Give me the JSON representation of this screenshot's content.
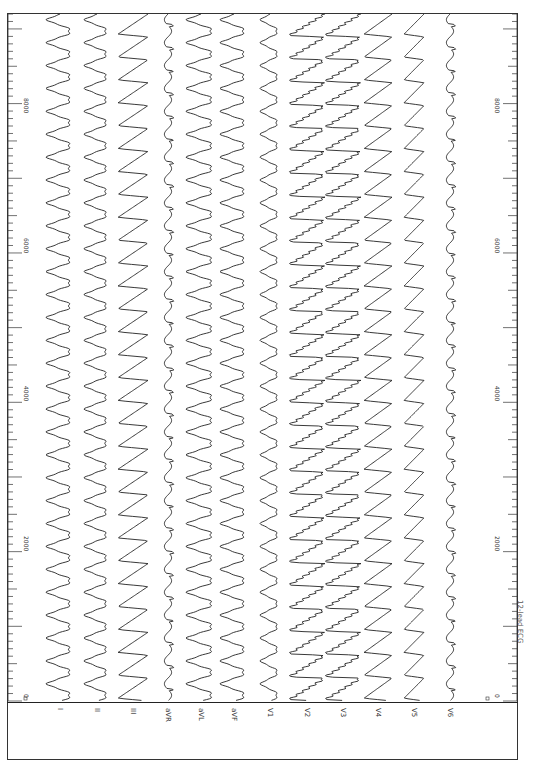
{
  "chart_data": {
    "type": "line",
    "title": "12-lead ECG",
    "orientation": "rotated-90",
    "xlabel": "samples",
    "ylabel": "",
    "x_range": [
      0,
      9200
    ],
    "x_ticks": [
      0,
      2000,
      4000,
      6000,
      8000
    ],
    "grid": false,
    "legend": "none",
    "series": [
      {
        "name": "I",
        "amplitude": 14,
        "shape": "biphasic-round"
      },
      {
        "name": "II",
        "amplitude": 13,
        "shape": "biphasic-round"
      },
      {
        "name": "III",
        "amplitude": 15,
        "shape": "sawtooth"
      },
      {
        "name": "aVR",
        "amplitude": 6,
        "shape": "small-notch"
      },
      {
        "name": "aVL",
        "amplitude": 15,
        "shape": "biphasic-round"
      },
      {
        "name": "aVF",
        "amplitude": 14,
        "shape": "biphasic-round"
      },
      {
        "name": "V1",
        "amplitude": 10,
        "shape": "biphasic-round"
      },
      {
        "name": "V2",
        "amplitude": 18,
        "shape": "sharp-sawtooth"
      },
      {
        "name": "V3",
        "amplitude": 18,
        "shape": "sharp-sawtooth"
      },
      {
        "name": "V4",
        "amplitude": 14,
        "shape": "sawtooth"
      },
      {
        "name": "V5",
        "amplitude": 10,
        "shape": "sawtooth"
      },
      {
        "name": "V6",
        "amplitude": 6,
        "shape": "small-notch"
      }
    ],
    "beats_visible": 30,
    "beat_period_samples": 305
  },
  "leads": [
    "I",
    "II",
    "III",
    "aVR",
    "aVL",
    "aVF",
    "V1",
    "V2",
    "V3",
    "V4",
    "V5",
    "V6"
  ],
  "axis": {
    "left_tick_labels": [
      "8000",
      "6000",
      "4000",
      "2000",
      "0"
    ],
    "right_tick_labels": [
      "8000",
      "6000",
      "4000",
      "2000",
      "0"
    ]
  },
  "caption": "12-lead ECG"
}
